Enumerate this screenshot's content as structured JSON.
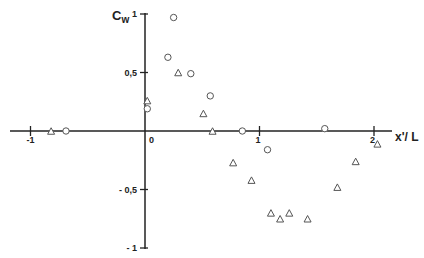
{
  "chart_data": {
    "type": "scatter",
    "title": "",
    "xlabel": "x'/L",
    "ylabel": "C_w",
    "ylabel_main": "C",
    "ylabel_sub": "w",
    "xlabel_main": "x",
    "xlabel_rest": "'/ L",
    "xlim": [
      -1.1,
      2.2
    ],
    "ylim": [
      -1,
      1
    ],
    "grid": false,
    "legend": null,
    "x_ticks": [
      {
        "value": -1,
        "label": "-1"
      },
      {
        "value": 0,
        "label": "0"
      },
      {
        "value": 1,
        "label": "1"
      },
      {
        "value": 2,
        "label": "2"
      }
    ],
    "y_ticks": [
      {
        "value": 1,
        "label": "1"
      },
      {
        "value": 0.5,
        "label": "0,5"
      },
      {
        "value": -0.5,
        "label": "- 0,5"
      },
      {
        "value": -1,
        "label": "- 1"
      }
    ],
    "series": [
      {
        "name": "circles",
        "marker": "circle",
        "points": [
          {
            "x": -0.69,
            "y": 0.0
          },
          {
            "x": 0.02,
            "y": 0.19
          },
          {
            "x": 0.2,
            "y": 0.63
          },
          {
            "x": 0.25,
            "y": 0.97
          },
          {
            "x": 0.4,
            "y": 0.49
          },
          {
            "x": 0.57,
            "y": 0.3
          },
          {
            "x": 0.85,
            "y": 0.0
          },
          {
            "x": 1.07,
            "y": -0.16
          },
          {
            "x": 1.57,
            "y": 0.02
          }
        ]
      },
      {
        "name": "triangles",
        "marker": "triangle",
        "points": [
          {
            "x": -0.82,
            "y": 0.0
          },
          {
            "x": 0.02,
            "y": 0.26
          },
          {
            "x": 0.29,
            "y": 0.5
          },
          {
            "x": 0.51,
            "y": 0.15
          },
          {
            "x": 0.59,
            "y": 0.0
          },
          {
            "x": 0.77,
            "y": -0.27
          },
          {
            "x": 0.93,
            "y": -0.42
          },
          {
            "x": 1.1,
            "y": -0.7
          },
          {
            "x": 1.18,
            "y": -0.75
          },
          {
            "x": 1.26,
            "y": -0.7
          },
          {
            "x": 1.42,
            "y": -0.75
          },
          {
            "x": 1.68,
            "y": -0.48
          },
          {
            "x": 1.84,
            "y": -0.26
          },
          {
            "x": 2.03,
            "y": -0.11
          }
        ]
      }
    ]
  },
  "style": {
    "axis_color": "#222222",
    "marker_color": "#555555"
  }
}
